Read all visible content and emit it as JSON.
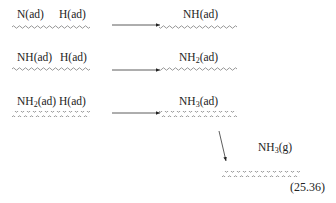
{
  "diagram": {
    "rows": [
      {
        "reactants": [
          {
            "species": "N",
            "sub": "",
            "state": "(ad)"
          },
          {
            "species": "H",
            "sub": "",
            "state": "(ad)"
          }
        ],
        "product": {
          "species": "NH",
          "sub": "",
          "state": "(ad)"
        }
      },
      {
        "reactants": [
          {
            "species": "NH",
            "sub": "",
            "state": "(ad)"
          },
          {
            "species": "H",
            "sub": "",
            "state": "(ad)"
          }
        ],
        "product": {
          "species": "NH",
          "sub": "2",
          "state": "(ad)"
        }
      },
      {
        "reactants": [
          {
            "species": "NH",
            "sub": "2",
            "state": "(ad)"
          },
          {
            "species": "H",
            "sub": "",
            "state": "(ad)"
          }
        ],
        "product": {
          "species": "NH",
          "sub": "3",
          "state": "(ad)"
        }
      }
    ],
    "desorption": {
      "species": "NH",
      "sub": "3",
      "state": "(g)"
    },
    "equation_number": "(25.36)",
    "surface_symbol": "wavy-line"
  }
}
